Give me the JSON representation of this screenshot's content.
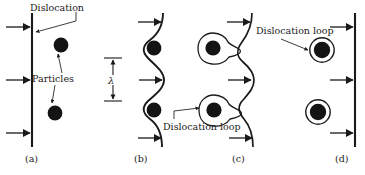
{
  "figure": {
    "title_present": false,
    "background_color": "#ffffff",
    "ink_color": "#1a1a1a",
    "particle_color": "#141414",
    "panels": [
      {
        "id": "a",
        "label": "(a)",
        "annotations": [
          {
            "name": "dislocation-label",
            "text": "Dislocation"
          },
          {
            "name": "particles-label",
            "text": "Particles"
          }
        ],
        "dislocation_shape": "straight-vertical-line",
        "particle_count": 2,
        "stress_arrow_count": 3
      },
      {
        "id": "b",
        "label": "(b)",
        "annotations": [
          {
            "name": "lambda-label",
            "text": "λ"
          }
        ],
        "dislocation_shape": "bowed-wavy-line",
        "particle_count": 2,
        "stress_arrow_count": 3
      },
      {
        "id": "c",
        "label": "(c)",
        "annotations": [
          {
            "name": "dislocation-loop-label",
            "text": "Dislocation loop"
          }
        ],
        "dislocation_shape": "pinching-wavy-line",
        "particle_count": 2,
        "stress_arrow_count": 3
      },
      {
        "id": "d",
        "label": "(d)",
        "annotations": [
          {
            "name": "dislocation-loop-label",
            "text": "Dislocation loop"
          }
        ],
        "dislocation_shape": "straight-vertical-line",
        "particle_count": 2,
        "stress_arrow_count": 3
      }
    ]
  }
}
